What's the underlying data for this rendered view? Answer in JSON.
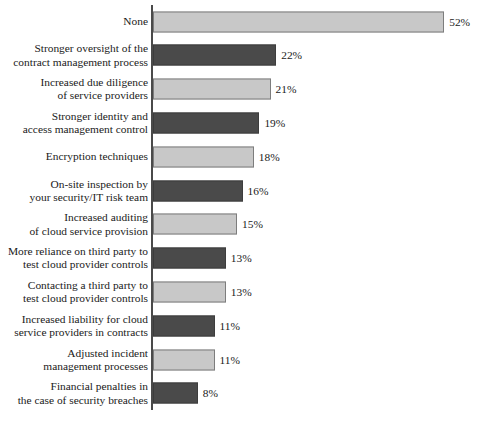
{
  "chart_data": {
    "type": "bar",
    "orientation": "horizontal",
    "title": "",
    "xlabel": "",
    "ylabel": "",
    "xlim": [
      0,
      52
    ],
    "grid": false,
    "legend": null,
    "value_suffix": "%",
    "categories": [
      "None",
      "Stronger oversight of the\ncontract management process",
      "Increased due diligence\nof service providers",
      "Stronger identity and\naccess management control",
      "Encryption techniques",
      "On-site inspection by\nyour security/IT risk team",
      "Increased auditing\nof cloud service provision",
      "More reliance on third party to\ntest cloud provider controls",
      "Contacting a third party to\ntest cloud provider controls",
      "Increased liability for cloud\nservice providers in contracts",
      "Adjusted incident\nmanagement processes",
      "Financial penalties in\nthe case of security breaches"
    ],
    "values": [
      52,
      22,
      21,
      19,
      18,
      16,
      15,
      13,
      13,
      11,
      11,
      8
    ],
    "value_labels": [
      "52%",
      "22%",
      "21%",
      "19%",
      "18%",
      "16%",
      "15%",
      "13%",
      "13%",
      "11%",
      "11%",
      "8%"
    ],
    "bar_styles": [
      "light",
      "dark",
      "light",
      "dark",
      "light",
      "dark",
      "light",
      "dark",
      "light",
      "dark",
      "light",
      "dark"
    ],
    "colors": {
      "light_fill": "#c8c8c8",
      "light_stroke": "#7d7d7d",
      "dark_fill": "#4a4a4a",
      "dark_stroke": "#3d3d3d",
      "axis": "#4a4a4a",
      "text": "#1a1a1a",
      "background": "#ffffff"
    }
  }
}
